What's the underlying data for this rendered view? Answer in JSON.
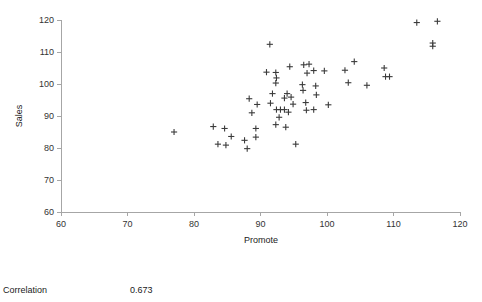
{
  "chart_data": {
    "type": "scatter",
    "title": "",
    "xlabel": "Promote",
    "ylabel": "Sales",
    "xlim": [
      60,
      120
    ],
    "ylim": [
      60,
      120
    ],
    "xticks": [
      60,
      70,
      80,
      90,
      100,
      110,
      120
    ],
    "yticks": [
      60,
      70,
      80,
      90,
      100,
      110,
      120
    ],
    "grid": false,
    "legend": null,
    "marker": "plus",
    "marker_color": "#3b3b3b",
    "series": [
      {
        "name": "Sales vs Promote",
        "points": [
          [
            77.0,
            85.0
          ],
          [
            82.9,
            86.7
          ],
          [
            84.6,
            86.1
          ],
          [
            85.6,
            83.6
          ],
          [
            83.6,
            81.2
          ],
          [
            84.8,
            80.9
          ],
          [
            87.6,
            82.4
          ],
          [
            88.0,
            79.8
          ],
          [
            88.3,
            95.4
          ],
          [
            89.5,
            93.6
          ],
          [
            88.7,
            91.0
          ],
          [
            89.3,
            86.1
          ],
          [
            89.3,
            83.4
          ],
          [
            91.4,
            112.4
          ],
          [
            90.9,
            103.7
          ],
          [
            92.3,
            103.6
          ],
          [
            92.4,
            101.9
          ],
          [
            92.3,
            100.3
          ],
          [
            91.8,
            97.0
          ],
          [
            91.5,
            94.0
          ],
          [
            92.4,
            92.0
          ],
          [
            92.8,
            89.6
          ],
          [
            92.3,
            87.3
          ],
          [
            93.6,
            95.6
          ],
          [
            93.0,
            92.0
          ],
          [
            93.6,
            92.0
          ],
          [
            93.8,
            86.5
          ],
          [
            94.4,
            105.4
          ],
          [
            94.0,
            97.0
          ],
          [
            94.6,
            95.9
          ],
          [
            94.9,
            93.7
          ],
          [
            94.2,
            91.2
          ],
          [
            95.3,
            81.2
          ],
          [
            96.5,
            106.0
          ],
          [
            97.3,
            106.2
          ],
          [
            97.0,
            103.4
          ],
          [
            96.3,
            99.8
          ],
          [
            96.4,
            98.0
          ],
          [
            96.8,
            94.2
          ],
          [
            96.9,
            91.8
          ],
          [
            98.0,
            104.2
          ],
          [
            98.3,
            99.4
          ],
          [
            98.4,
            96.6
          ],
          [
            98.0,
            92.0
          ],
          [
            99.6,
            104.1
          ],
          [
            100.2,
            93.5
          ],
          [
            102.7,
            104.3
          ],
          [
            103.2,
            100.4
          ],
          [
            104.1,
            107.0
          ],
          [
            106.0,
            99.6
          ],
          [
            108.6,
            105.0
          ],
          [
            108.8,
            102.3
          ],
          [
            109.4,
            102.3
          ],
          [
            113.5,
            119.2
          ],
          [
            116.6,
            119.6
          ],
          [
            115.9,
            112.8
          ],
          [
            115.9,
            111.8
          ]
        ]
      }
    ]
  },
  "footer": {
    "label": "Correlation",
    "value": "0.673"
  }
}
